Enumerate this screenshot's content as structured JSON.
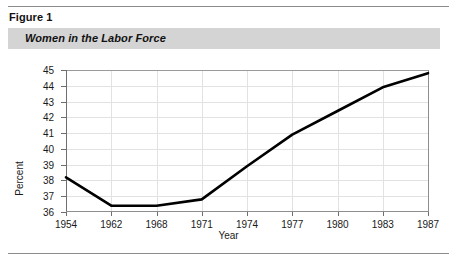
{
  "header": {
    "figure_label": "Figure 1",
    "title": "Women in the Labor Force"
  },
  "chart_data": {
    "type": "line",
    "title": "Women in the Labor Force",
    "xlabel": "Year",
    "ylabel": "Percent",
    "categories": [
      "1954",
      "1962",
      "1968",
      "1971",
      "1974",
      "1977",
      "1980",
      "1983",
      "1987"
    ],
    "values": [
      38.2,
      36.4,
      36.4,
      36.8,
      38.9,
      40.9,
      42.4,
      43.9,
      44.8
    ],
    "ylim": [
      36,
      45
    ],
    "yticks": [
      36,
      37,
      38,
      39,
      40,
      41,
      42,
      43,
      44,
      45
    ],
    "grid": true,
    "legend": "none",
    "series_color": "#000000"
  },
  "colors": {
    "band": "#d4d4d4",
    "rule": "#8c8c8c",
    "grid": "#e2e2e2",
    "axis": "#6e6e6e",
    "line": "#000000"
  }
}
